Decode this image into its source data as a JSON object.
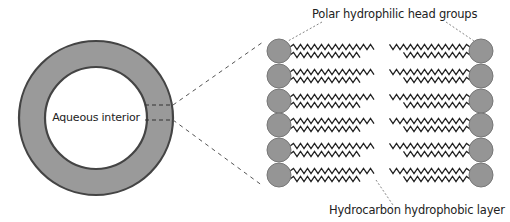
{
  "diagram": {
    "type": "lipid-bilayer-vesicle",
    "labels": {
      "interior": "Aqueous interior",
      "head_groups": "Polar hydrophilic head groups",
      "tail_layer": "Hydrocarbon hydrophobic layer"
    },
    "colors": {
      "membrane_fill": "#999999",
      "membrane_stroke": "#444444",
      "interior_fill": "#ffffff",
      "head_fill": "#959595",
      "head_stroke": "#777777",
      "tail_stroke": "#222222",
      "leader_line": "#555555"
    },
    "vesicle": {
      "cx": 96,
      "cy": 118,
      "outer_r": 77,
      "inner_r": 51
    },
    "bilayer": {
      "rows": 6,
      "row_y": [
        51,
        76,
        101,
        125,
        150,
        175
      ],
      "left_head_x": 279,
      "right_head_x": 481,
      "head_r": 12
    }
  }
}
